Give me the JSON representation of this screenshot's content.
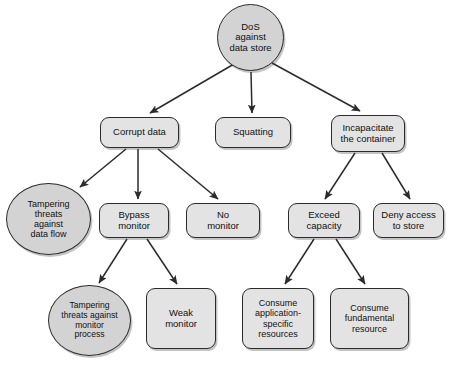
{
  "diagram": {
    "type": "attack-tree",
    "colors": {
      "box_fill": "#e3e3e3",
      "ellipse_fill": "#d3d3d3",
      "stroke": "#2b2b2b",
      "text": "#111111",
      "background": "#ffffff"
    },
    "nodes": [
      {
        "id": "dos-against-data-store",
        "label": "DoS\nagainst\ndata store",
        "shape": "ellipse",
        "x": 217,
        "y": 4,
        "w": 67,
        "h": 67,
        "font_size": 9.5
      },
      {
        "id": "corrupt-data",
        "label": "Corrupt data",
        "shape": "box",
        "x": 100,
        "y": 117,
        "w": 79,
        "h": 31,
        "font_size": 9.5
      },
      {
        "id": "squatting",
        "label": "Squatting",
        "shape": "box",
        "x": 215,
        "y": 117,
        "w": 76,
        "h": 31,
        "font_size": 9.5
      },
      {
        "id": "incapacitate-the-container",
        "label": "Incapacitate\nthe container",
        "shape": "box",
        "x": 331,
        "y": 115,
        "w": 74,
        "h": 37,
        "font_size": 9.5
      },
      {
        "id": "tampering-threats-against-data-flow",
        "label": "Tampering\nthreats\nagainst\ndata flow",
        "shape": "ellipse",
        "x": 6,
        "y": 183,
        "w": 85,
        "h": 72,
        "font_size": 9.0
      },
      {
        "id": "bypass-monitor",
        "label": "Bypass\nmonitor",
        "shape": "box",
        "x": 99,
        "y": 203,
        "w": 70,
        "h": 35,
        "font_size": 9.5
      },
      {
        "id": "no-monitor",
        "label": "No\nmonitor",
        "shape": "box",
        "x": 186,
        "y": 203,
        "w": 74,
        "h": 35,
        "font_size": 9.5
      },
      {
        "id": "exceed-capacity",
        "label": "Exceed\ncapacity",
        "shape": "box",
        "x": 288,
        "y": 203,
        "w": 72,
        "h": 35,
        "font_size": 9.5
      },
      {
        "id": "deny-access-to-store",
        "label": "Deny access\nto store",
        "shape": "box",
        "x": 373,
        "y": 203,
        "w": 71,
        "h": 35,
        "font_size": 9.5
      },
      {
        "id": "tampering-threats-against-monitor-process",
        "label": "Tampering\nthreats against\nmonitor\nprocess",
        "shape": "ellipse",
        "x": 48,
        "y": 285,
        "w": 83,
        "h": 71,
        "font_size": 8.6
      },
      {
        "id": "weak-monitor",
        "label": "Weak\nmonitor",
        "shape": "box",
        "x": 146,
        "y": 288,
        "w": 70,
        "h": 61,
        "font_size": 9.5
      },
      {
        "id": "consume-application-specific-resources",
        "label": "Consume\napplication-\nspecific\nresources",
        "shape": "box",
        "x": 242,
        "y": 288,
        "w": 72,
        "h": 61,
        "font_size": 9.0
      },
      {
        "id": "consume-fundamental-resource",
        "label": "Consume\nfundamental\nresource",
        "shape": "box",
        "x": 330,
        "y": 288,
        "w": 79,
        "h": 61,
        "font_size": 9.0
      }
    ],
    "edges": [
      {
        "from": "dos-against-data-store",
        "to": "corrupt-data",
        "x1": 234,
        "y1": 64,
        "x2": 150,
        "y2": 113
      },
      {
        "from": "dos-against-data-store",
        "to": "squatting",
        "x1": 251,
        "y1": 72,
        "x2": 252,
        "y2": 113
      },
      {
        "from": "dos-against-data-store",
        "to": "incapacitate-the-container",
        "x1": 272,
        "y1": 63,
        "x2": 360,
        "y2": 111
      },
      {
        "from": "corrupt-data",
        "to": "tampering-threats-against-data-flow",
        "x1": 126,
        "y1": 149,
        "x2": 80,
        "y2": 187
      },
      {
        "from": "corrupt-data",
        "to": "bypass-monitor",
        "x1": 138,
        "y1": 149,
        "x2": 138,
        "y2": 199
      },
      {
        "from": "corrupt-data",
        "to": "no-monitor",
        "x1": 158,
        "y1": 149,
        "x2": 218,
        "y2": 199
      },
      {
        "from": "incapacitate-the-container",
        "to": "exceed-capacity",
        "x1": 355,
        "y1": 153,
        "x2": 325,
        "y2": 199
      },
      {
        "from": "incapacitate-the-container",
        "to": "deny-access-to-store",
        "x1": 382,
        "y1": 153,
        "x2": 410,
        "y2": 199
      },
      {
        "from": "bypass-monitor",
        "to": "tampering-threats-against-monitor-process",
        "x1": 127,
        "y1": 239,
        "x2": 99,
        "y2": 283
      },
      {
        "from": "bypass-monitor",
        "to": "weak-monitor",
        "x1": 147,
        "y1": 239,
        "x2": 177,
        "y2": 284
      },
      {
        "from": "exceed-capacity",
        "to": "consume-application-specific-resources",
        "x1": 314,
        "y1": 239,
        "x2": 285,
        "y2": 284
      },
      {
        "from": "exceed-capacity",
        "to": "consume-fundamental-resource",
        "x1": 336,
        "y1": 239,
        "x2": 365,
        "y2": 284
      }
    ]
  }
}
